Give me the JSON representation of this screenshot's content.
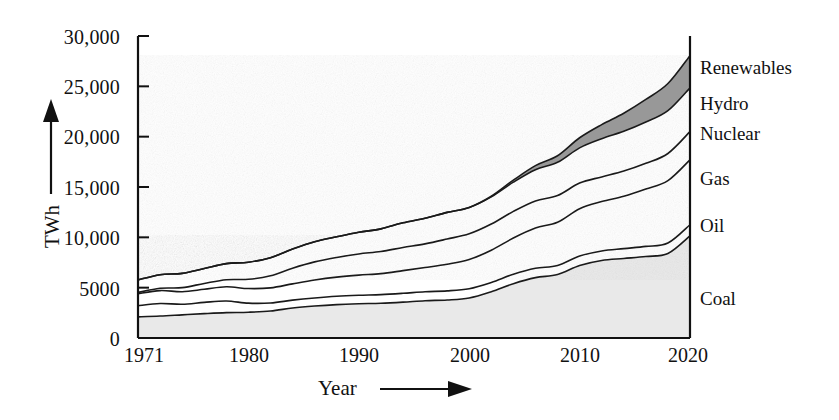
{
  "chart_data": {
    "type": "area",
    "title": "",
    "subtitle": "",
    "xlabel": "Year",
    "ylabel": "TWh",
    "stacked": true,
    "grid": false,
    "legend_position": "right-inline",
    "xlim": [
      1971,
      2021
    ],
    "ylim": [
      0,
      30000
    ],
    "x_ticks": [
      1971,
      1980,
      1990,
      2000,
      2010,
      2020
    ],
    "x_tick_labels": [
      "1971",
      "1980",
      "1990",
      "2000",
      "2010",
      "2020"
    ],
    "y_ticks": [
      0,
      5000,
      10000,
      15000,
      20000,
      25000,
      30000
    ],
    "y_tick_labels": [
      "0",
      "5000",
      "10,000",
      "15,000",
      "20,000",
      "25,000",
      "30,000"
    ],
    "x": [
      1971,
      1973,
      1975,
      1977,
      1979,
      1981,
      1983,
      1985,
      1987,
      1989,
      1991,
      1993,
      1995,
      1997,
      1999,
      2001,
      2003,
      2005,
      2007,
      2009,
      2011,
      2013,
      2015,
      2017,
      2019,
      2021
    ],
    "series": [
      {
        "name": "Coal",
        "fill": "#e9e9e9",
        "values": [
          2100,
          2180,
          2300,
          2420,
          2520,
          2560,
          2680,
          2980,
          3180,
          3320,
          3400,
          3450,
          3560,
          3700,
          3780,
          3980,
          4600,
          5400,
          6000,
          6300,
          7200,
          7700,
          7900,
          8100,
          8400,
          10150
        ]
      },
      {
        "name": "Oil",
        "fill": "#ffffff",
        "values": [
          1100,
          1250,
          1050,
          1120,
          1150,
          900,
          800,
          780,
          800,
          830,
          850,
          860,
          880,
          900,
          900,
          920,
          920,
          930,
          920,
          900,
          940,
          950,
          980,
          1000,
          1030,
          1100
        ]
      },
      {
        "name": "Gas",
        "fill": "#ffffff",
        "values": [
          1200,
          1280,
          1250,
          1300,
          1420,
          1450,
          1500,
          1620,
          1780,
          1900,
          2000,
          2080,
          2250,
          2400,
          2650,
          2900,
          3200,
          3600,
          4000,
          4300,
          4700,
          4900,
          5200,
          5700,
          6200,
          6450
        ]
      },
      {
        "name": "Nuclear",
        "fill": "#ffffff",
        "values": [
          120,
          230,
          400,
          580,
          700,
          920,
          1200,
          1550,
          1800,
          1950,
          2100,
          2200,
          2300,
          2350,
          2500,
          2550,
          2600,
          2650,
          2700,
          2650,
          2550,
          2450,
          2500,
          2550,
          2700,
          2800
        ]
      },
      {
        "name": "Hydro",
        "fill": "#ffffff",
        "values": [
          1250,
          1350,
          1420,
          1480,
          1600,
          1700,
          1800,
          1900,
          2000,
          2050,
          2150,
          2250,
          2450,
          2550,
          2650,
          2620,
          2700,
          2900,
          3100,
          3300,
          3500,
          3800,
          3950,
          4100,
          4250,
          4350
        ]
      },
      {
        "name": "Renewables",
        "fill": "#989898",
        "values": [
          0,
          0,
          0,
          0,
          0,
          0,
          0,
          0,
          0,
          0,
          0,
          0,
          0,
          0,
          0,
          0,
          60,
          200,
          400,
          650,
          1000,
          1400,
          1800,
          2250,
          2700,
          3200
        ]
      }
    ],
    "legend_entries": [
      {
        "label": "Renewables",
        "swatch": "#989898"
      },
      {
        "label": "Hydro",
        "swatch": "#ffffff"
      },
      {
        "label": "Nuclear",
        "swatch": "#ffffff"
      },
      {
        "label": "Gas",
        "swatch": "#ffffff"
      },
      {
        "label": "Oil",
        "swatch": "#ffffff"
      },
      {
        "label": "Coal",
        "swatch": "#e9e9e9"
      }
    ]
  },
  "axes": {
    "y_label": "TWh",
    "x_label": "Year"
  }
}
